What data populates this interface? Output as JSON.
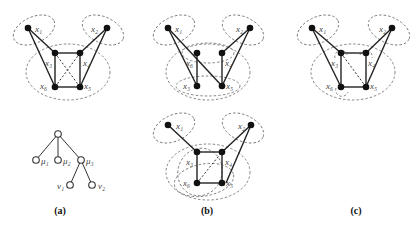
{
  "figure": {
    "panels": [
      {
        "id": "a",
        "caption": "(a)",
        "graph_labels": [
          "x1",
          "x2",
          "x3",
          "x4",
          "x5",
          "x6"
        ],
        "tree_labels": [
          "μ1",
          "μ2",
          "μ3",
          "v1",
          "v2"
        ]
      },
      {
        "id": "b",
        "caption": "(b)",
        "top_graph_labels": [
          "x1",
          "x2",
          "x6",
          "x4",
          "x3",
          "x5"
        ],
        "bottom_graph_labels": [
          "x1",
          "x2",
          "x3",
          "x4",
          "x6",
          "x5"
        ]
      },
      {
        "id": "c",
        "caption": "(c)",
        "graph_labels": [
          "x1",
          "x2",
          "x3",
          "x4",
          "x6",
          "x5"
        ]
      }
    ]
  },
  "labels": {
    "a": {
      "x1": "x₁",
      "x2": "x₂",
      "x3": "x₃",
      "x4": "x₄",
      "x5": "x₅",
      "x6": "x₆",
      "mu1": "μ₁",
      "mu2": "μ₂",
      "mu3": "μ₃",
      "v1": "ν₁",
      "v2": "ν₂",
      "caption": "(a)"
    },
    "b_top": {
      "x1": "x₁",
      "x2": "x₂",
      "x6": "x₆",
      "x4": "x₄",
      "x3": "x₃",
      "x5": "x₅"
    },
    "b_bottom": {
      "x1": "x₁",
      "x2": "x₂",
      "x3": "x₃",
      "x4": "x₄",
      "x6": "x₆",
      "x5": "x₅",
      "caption": "(b)"
    },
    "c": {
      "x1": "x₁",
      "x2": "x₂",
      "x3": "x₃",
      "x4": "x₄",
      "x6": "x₆",
      "x5": "x₅",
      "caption": "(c)"
    }
  }
}
